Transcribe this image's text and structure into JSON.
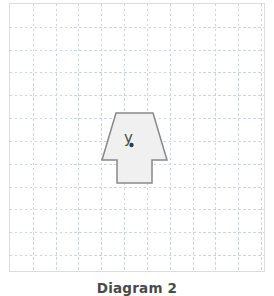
{
  "caption": {
    "text": "Diagram 2"
  },
  "grid": {
    "line_color": "#c9d4de",
    "border_color": "#dcdcdc",
    "background": "#ffffff",
    "cell_size_px": 23,
    "columns": 11,
    "rows": 11,
    "dashed": true
  },
  "figure": {
    "name": "trapezoid-with-rectangle",
    "fill_color": "#f0f0f0",
    "stroke_color": "#888888",
    "stroke_width": 1.5,
    "outline_points": "116,113 153,113 167,160 152,160 152,183 117,183 117,160 102,160",
    "label": {
      "text": "y",
      "x": 124,
      "y": 143,
      "color": "#4a4a4a",
      "font_size": 15
    },
    "point_marker": {
      "name": "point-y",
      "cx": 131.5,
      "cy": 145,
      "r": 2.2,
      "color": "#3a3a3a"
    }
  }
}
